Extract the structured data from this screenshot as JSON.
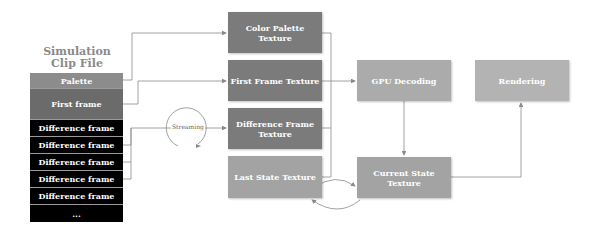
{
  "clip_file": {
    "title_line1": "Simulation",
    "title_line2": "Clip File",
    "segments": [
      {
        "label": "Palette",
        "color": "#8c8c8c"
      },
      {
        "label": "First frame",
        "color": "#6b6b6b"
      },
      {
        "label": "Difference frame",
        "color": "#000000"
      },
      {
        "label": "Difference frame",
        "color": "#000000"
      },
      {
        "label": "Difference frame",
        "color": "#000000"
      },
      {
        "label": "Difference frame",
        "color": "#000000"
      },
      {
        "label": "Difference frame",
        "color": "#000000"
      },
      {
        "label": "...",
        "color": "#000000"
      }
    ]
  },
  "textures": {
    "color_palette": "Color Palette Texture",
    "first_frame": "First Frame Texture",
    "difference_frame": "Difference Frame Texture",
    "last_state": "Last State Texture",
    "current_state": "Current State Texture"
  },
  "stages": {
    "gpu_decoding": "GPU Decoding",
    "rendering": "Rendering"
  },
  "edges": {
    "streaming_label": "Streaming"
  },
  "colors": {
    "dark_texture": "#7b7b7b",
    "light_texture": "#a3a3a3",
    "stage": "#ababab",
    "wire": "#8a8a8a"
  }
}
